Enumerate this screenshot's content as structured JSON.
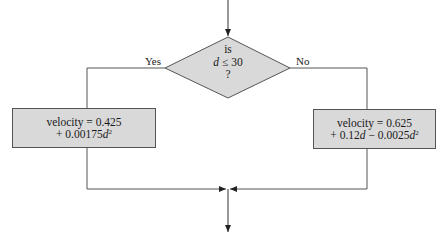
{
  "flowchart": {
    "decision": {
      "line1": "is",
      "line2_var": "d",
      "line2_rest": " ≤ 30",
      "line3": "?"
    },
    "branches": {
      "yes_label": "Yes",
      "no_label": "No"
    },
    "yes_box": {
      "line1": "velocity = 0.425",
      "line2_prefix": "+ 0.00175",
      "line2_var": "d",
      "line2_exp": "2"
    },
    "no_box": {
      "line1": "velocity = 0.625",
      "line2_prefix": "+ 0.12",
      "line2_var1": "d",
      "line2_mid": " − 0.0025",
      "line2_var2": "d",
      "line2_exp": "2"
    },
    "colors": {
      "line": "#555555",
      "fill": "#d9d9d9",
      "background": "#ffffff"
    }
  }
}
